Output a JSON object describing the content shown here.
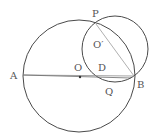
{
  "diagram": {
    "type": "geometry",
    "colors": {
      "circle_stroke": "#4a4a4a",
      "line_stroke": "#8a8a8a",
      "label": "#555555",
      "background": "#ffffff"
    },
    "circles": [
      {
        "name": "circle-O",
        "center": "O",
        "cx": 79,
        "cy": 76,
        "r": 56
      },
      {
        "name": "circle-O-prime",
        "center": "O'",
        "cx": 115,
        "cy": 49,
        "r": 33
      }
    ],
    "points": {
      "A": {
        "x": 23,
        "y": 75
      },
      "B": {
        "x": 134,
        "y": 76
      },
      "O": {
        "x": 80,
        "y": 77
      },
      "P": {
        "x": 96,
        "y": 23
      },
      "Q": {
        "x": 130,
        "y": 79
      }
    },
    "segments": [
      {
        "from": "A",
        "to": "B"
      },
      {
        "from": "A",
        "to": "Q"
      },
      {
        "from": "P",
        "to": "B"
      }
    ],
    "labels": {
      "A": "A",
      "B": "B",
      "O": "O",
      "O_prime": "O′",
      "D": "D",
      "P": "P",
      "Q": "Q"
    }
  }
}
